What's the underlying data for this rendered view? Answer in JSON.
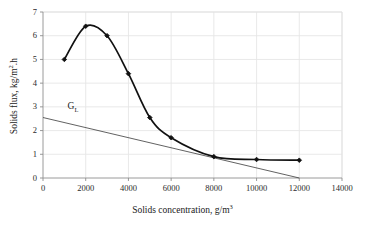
{
  "chart_data": {
    "type": "line",
    "title": "",
    "xlabel_text": "Solids concentration, g/m",
    "xlabel_sup": "3",
    "ylabel_text": "Solids flux, kg/m",
    "ylabel_sup": "2",
    "ylabel_tail": ".h",
    "xlim": [
      0,
      14000
    ],
    "ylim": [
      0,
      7
    ],
    "grid": true,
    "legend_position": "none",
    "xticks": [
      0,
      2000,
      4000,
      6000,
      8000,
      10000,
      12000,
      14000
    ],
    "xtick_labels": [
      "0",
      "2000",
      "4000",
      "6000",
      "8000",
      "10000",
      "12000",
      "14000"
    ],
    "yticks": [
      0,
      1,
      2,
      3,
      4,
      5,
      6,
      7
    ],
    "ytick_labels": [
      "0",
      "1",
      "2",
      "3",
      "4",
      "5",
      "6",
      "7"
    ],
    "series": [
      {
        "name": "Solids flux curve",
        "style": "smooth-line-with-markers",
        "color": "#111111",
        "marker": "diamond",
        "x": [
          1000,
          2000,
          3000,
          4000,
          5000,
          6000,
          8000,
          10000,
          12000
        ],
        "values": [
          5.0,
          6.4,
          6.0,
          4.4,
          2.55,
          1.7,
          0.9,
          0.78,
          0.75
        ]
      },
      {
        "name": "GL",
        "style": "straight-line",
        "color": "#3a3a3a",
        "marker": "none",
        "x": [
          0,
          12000
        ],
        "values": [
          2.55,
          0.0
        ]
      }
    ],
    "annotations": [
      {
        "id": "gl",
        "text_main": "G",
        "text_sub": "L",
        "x": 1150,
        "y": 2.95
      }
    ]
  }
}
